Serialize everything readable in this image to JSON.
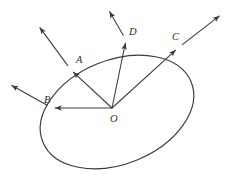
{
  "figure": {
    "type": "geometric-vector-diagram",
    "background_color": "#ffffff",
    "stroke_color": "#3a3a3a",
    "label_color": "#2e2e2e",
    "width": 234,
    "height": 189
  },
  "ellipse": {
    "center_x": 117,
    "center_y": 112,
    "radius_x": 80,
    "radius_y": 52,
    "rotation_deg": -22
  },
  "origin": {
    "label": "O",
    "x": 112,
    "y": 108,
    "label_x": 110,
    "label_y": 122
  },
  "vectors": [
    {
      "label": "A",
      "point_x": 71,
      "point_y": 70,
      "label_x": 76,
      "label_y": 63,
      "outer_tip_x": 38,
      "outer_tip_y": 25,
      "description": "vector O to A, continues outward up-left"
    },
    {
      "label": "B",
      "point_x": 52,
      "point_y": 108,
      "label_x": 44,
      "label_y": 103,
      "outer_tip_x": 9,
      "outer_tip_y": 84,
      "description": "vector O to B horizontal left, continues outward up-left"
    },
    {
      "label": "C",
      "point_x": 178,
      "point_y": 48,
      "label_x": 172,
      "label_y": 40,
      "outer_tip_x": 222,
      "outer_tip_y": 14,
      "description": "vector O to C, continues outward up-right"
    },
    {
      "label": "D",
      "point_x": 126,
      "point_y": 40,
      "label_x": 129,
      "label_y": 35,
      "outer_tip_x": 108,
      "outer_tip_y": 9,
      "description": "vector O to D nearly vertical, continues outward up-left"
    }
  ]
}
